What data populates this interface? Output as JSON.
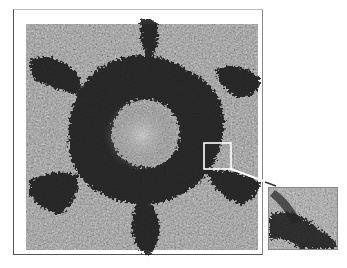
{
  "figure": {
    "main_panel": {
      "frame": {
        "x": 13,
        "y": 9,
        "width": 250,
        "height": 246
      },
      "image_area": {
        "x": 26,
        "y": 24,
        "width": 232,
        "height": 226
      }
    },
    "selection_box": {
      "x": 204,
      "y": 143,
      "width": 27,
      "height": 26,
      "color": "#ffffff"
    },
    "connector_arrow": {
      "from": [
        231,
        169
      ],
      "to": [
        276,
        186
      ],
      "color": "#ffffff"
    },
    "inset_panel": {
      "x": 268,
      "y": 187,
      "width": 70,
      "height": 63
    },
    "colors": {
      "background": "#ffffff",
      "frame": "#555555",
      "texture_light": "#c8c8c8",
      "texture_dark": "#1e1e1e"
    }
  }
}
